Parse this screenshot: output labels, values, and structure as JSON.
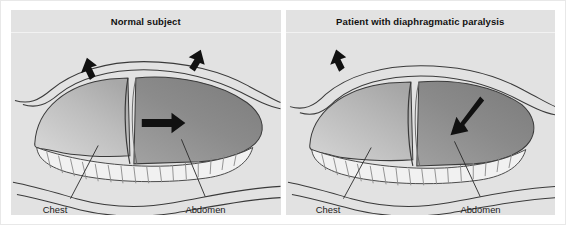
{
  "figure": {
    "background_color": "#ffffff",
    "panel_background_color": "#e2e2e2",
    "outline_color": "#222222",
    "chest_fill_color": "#b8b8b8",
    "abdomen_fill_color": "#8f8f8f",
    "rib_fill_color": "#f0f0f0",
    "arrow_color": "#111111"
  },
  "panels": [
    {
      "id": "normal-subject",
      "title": "Normal subject",
      "labels": {
        "chest": "Chest",
        "abdomen": "Abdomen"
      },
      "arrows": [
        {
          "name": "chest-expansion-arrow-left",
          "direction": "up-left",
          "region": "chest-wall"
        },
        {
          "name": "chest-expansion-arrow-right",
          "direction": "up-right",
          "region": "chest-wall"
        },
        {
          "name": "diaphragm-descent-arrow",
          "direction": "right",
          "region": "abdomen"
        }
      ]
    },
    {
      "id": "diaphragmatic-paralysis",
      "title": "Patient with diaphragmatic paralysis",
      "labels": {
        "chest": "Chest",
        "abdomen": "Abdomen"
      },
      "arrows": [
        {
          "name": "chest-expansion-arrow-left",
          "direction": "up-left",
          "region": "chest-wall"
        },
        {
          "name": "paradoxical-inward-arrow",
          "direction": "down-left",
          "region": "abdomen"
        }
      ]
    }
  ]
}
